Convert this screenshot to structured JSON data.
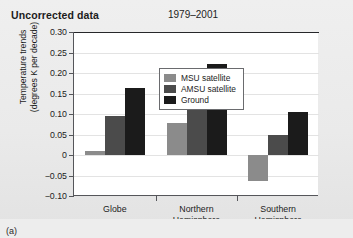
{
  "header": {
    "title": "Uncorrected data",
    "period": "1979–2001"
  },
  "caption": "(a)",
  "legend": {
    "items": [
      {
        "label": "MSU satellite",
        "color": "#8b8b8b"
      },
      {
        "label": "AMSU satellite",
        "color": "#4b4b4b"
      },
      {
        "label": "Ground",
        "color": "#1b1b1b"
      }
    ]
  },
  "axis": {
    "y_title_line1": "Temperature trends",
    "y_title_line2": "(degrees K per decade)",
    "y_ticks": [
      "0.30",
      "0.25",
      "0.20",
      "0.15",
      "0.10",
      "0.05",
      "0",
      "−0.05",
      "−0.10"
    ]
  },
  "chart_data": {
    "type": "bar",
    "title": "Uncorrected data",
    "subtitle": "1979–2001",
    "xlabel": "",
    "ylabel": "Temperature trends (degrees K per decade)",
    "ylim": [
      -0.1,
      0.3
    ],
    "ytick_values": [
      0.3,
      0.25,
      0.2,
      0.15,
      0.1,
      0.05,
      0,
      -0.05,
      -0.1
    ],
    "grid": true,
    "legend_position": "top-left-inside",
    "categories": [
      "Globe",
      "Northern Hemisphere",
      "Southern Hemisphere"
    ],
    "category_labels": [
      [
        "Globe"
      ],
      [
        "Northern",
        "Hemisphere"
      ],
      [
        "Southern",
        "Hemisphere"
      ]
    ],
    "series": [
      {
        "name": "MSU satellite",
        "color": "#8b8b8b",
        "values": [
          0.01,
          0.079,
          -0.063
        ]
      },
      {
        "name": "AMSU satellite",
        "color": "#4b4b4b",
        "values": [
          0.096,
          0.143,
          0.049
        ]
      },
      {
        "name": "Ground",
        "color": "#1b1b1b",
        "values": [
          0.164,
          0.222,
          0.104
        ]
      }
    ]
  }
}
